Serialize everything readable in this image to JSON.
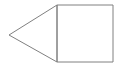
{
  "canvas": {
    "width": 119,
    "height": 68,
    "background_color": "#ffffff",
    "title": "Arrow shape: left-pointing triangle joined to a square"
  },
  "style": {
    "stroke_color": "#808080",
    "stroke_width": 1,
    "fill_color": "none",
    "line_cap": "butt",
    "line_join": "miter"
  },
  "chart_data": {
    "type": "diagram",
    "xlabel": "",
    "ylabel": "",
    "xlim": [
      0,
      119
    ],
    "ylim": [
      0,
      68
    ],
    "grid": false,
    "legend": "none",
    "shapes": [
      {
        "name": "square",
        "kind": "rect",
        "x": 57,
        "y": 5,
        "width": 56,
        "height": 57,
        "points": [
          [
            57,
            5
          ],
          [
            113,
            5
          ],
          [
            113,
            62
          ],
          [
            57,
            62
          ]
        ],
        "stroke": "#808080",
        "fill": "none"
      },
      {
        "name": "triangle",
        "kind": "polygon",
        "points": [
          [
            57,
            5
          ],
          [
            9,
            35
          ],
          [
            57,
            62
          ]
        ],
        "stroke": "#808080",
        "fill": "none",
        "apex": [
          9,
          35
        ],
        "direction": "left"
      }
    ],
    "segments": [
      {
        "name": "square-top-edge",
        "from": [
          57,
          5
        ],
        "to": [
          113,
          5
        ]
      },
      {
        "name": "square-right-edge",
        "from": [
          113,
          5
        ],
        "to": [
          113,
          62
        ]
      },
      {
        "name": "square-bottom-edge",
        "from": [
          113,
          62
        ],
        "to": [
          57,
          62
        ]
      },
      {
        "name": "shared-vertical-edge",
        "from": [
          57,
          62
        ],
        "to": [
          57,
          5
        ]
      },
      {
        "name": "triangle-upper-edge",
        "from": [
          57,
          5
        ],
        "to": [
          9,
          35
        ]
      },
      {
        "name": "triangle-lower-edge",
        "from": [
          9,
          35
        ],
        "to": [
          57,
          62
        ]
      }
    ],
    "annotations": [],
    "labels": []
  }
}
